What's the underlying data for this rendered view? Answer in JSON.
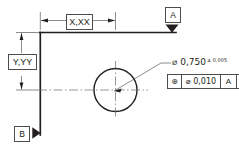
{
  "drawing": {
    "title": "GD&T position tolerance callout detail",
    "type": "engineering-drawing",
    "colors": {
      "line": "#231f20",
      "thin_line": "#4d4d4d",
      "center_line": "#6b6b6b",
      "background": "#ffffff"
    },
    "dimensions": [
      {
        "name": "horizontal-dimension",
        "label": "X,XX",
        "orientation": "horizontal",
        "from": "datum-B-vertical-edge",
        "to": "hole-centerline"
      },
      {
        "name": "vertical-dimension",
        "label": "Y,YY",
        "orientation": "vertical",
        "from": "datum-A-top-edge",
        "to": "hole-centerline"
      }
    ],
    "datums": [
      {
        "name": "datum-a",
        "letter": "A",
        "arrow": "down",
        "attached_to": "top-horizontal-surface"
      },
      {
        "name": "datum-b",
        "letter": "B",
        "arrow": "left",
        "attached_to": "left-vertical-surface"
      }
    ],
    "hole": {
      "name": "hole-feature",
      "diameter_symbol": "⌀",
      "diameter_value": "0,750",
      "tolerance_symbol": "±",
      "tolerance_value": "0,005",
      "callout_text": "⌀ 0,750",
      "tolerance_text": "± 0,005"
    },
    "feature_control_frame": {
      "name": "position-feature-control-frame",
      "geometric_symbol": "⊕",
      "geometric_characteristic": "position",
      "diameter_symbol": "⌀",
      "tolerance_value": "0,010",
      "tolerance_text": "⌀ 0,010",
      "primary_datum": "A",
      "secondary_datum": "B"
    }
  }
}
